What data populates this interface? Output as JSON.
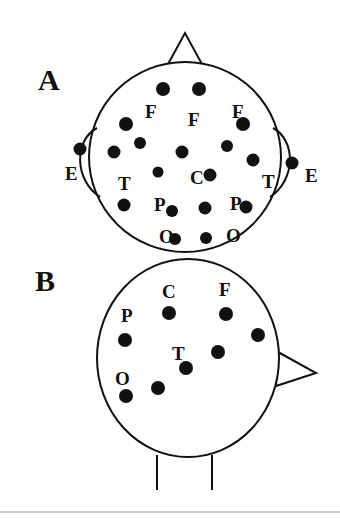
{
  "figure": {
    "width": 340,
    "height": 518,
    "background_color": "#ffffff",
    "ink_color": "#111111",
    "rule_color": "#b9b9b9"
  },
  "panels": [
    {
      "id": "A",
      "letter": "A",
      "letter_pos": {
        "x": 38,
        "y": 90
      },
      "view": "top-down head, nose up, both ears shown",
      "head": {
        "cx": 185,
        "cy": 157,
        "rx": 96,
        "ry": 95
      },
      "nose": {
        "apex": {
          "x": 185,
          "y": 33
        },
        "left": {
          "x": 167,
          "y": 66
        },
        "right": {
          "x": 203,
          "y": 66
        }
      },
      "ears": [
        {
          "side": "left",
          "path": "M 97 128 C 75 140, 75 178, 100 196"
        },
        {
          "side": "right",
          "path": "M 273 128 C 295 140, 295 178, 270 196"
        }
      ],
      "labels": [
        {
          "text": "F",
          "x": 145,
          "y": 118
        },
        {
          "text": "F",
          "x": 188,
          "y": 126
        },
        {
          "text": "F",
          "x": 232,
          "y": 118
        },
        {
          "text": "E",
          "x": 65,
          "y": 180
        },
        {
          "text": "T",
          "x": 118,
          "y": 190
        },
        {
          "text": "C",
          "x": 190,
          "y": 184
        },
        {
          "text": "T",
          "x": 262,
          "y": 188
        },
        {
          "text": "E",
          "x": 305,
          "y": 182
        },
        {
          "text": "P",
          "x": 154,
          "y": 211
        },
        {
          "text": "P",
          "x": 230,
          "y": 210
        },
        {
          "text": "O",
          "x": 159,
          "y": 243
        },
        {
          "text": "O",
          "x": 226,
          "y": 242
        }
      ],
      "electrodes": [
        {
          "x": 163,
          "y": 89,
          "r": 7
        },
        {
          "x": 199,
          "y": 89,
          "r": 7
        },
        {
          "x": 126,
          "y": 124,
          "r": 7
        },
        {
          "x": 243,
          "y": 124,
          "r": 7
        },
        {
          "x": 140,
          "y": 143,
          "r": 6
        },
        {
          "x": 227,
          "y": 146,
          "r": 6
        },
        {
          "x": 114,
          "y": 152,
          "r": 6.5
        },
        {
          "x": 253,
          "y": 160,
          "r": 6.5
        },
        {
          "x": 182,
          "y": 152,
          "r": 6.5
        },
        {
          "x": 158,
          "y": 172,
          "r": 5.5
        },
        {
          "x": 210,
          "y": 175,
          "r": 6.5
        },
        {
          "x": 80,
          "y": 149,
          "r": 6.5
        },
        {
          "x": 292,
          "y": 163,
          "r": 6.5
        },
        {
          "x": 124,
          "y": 205,
          "r": 6.5
        },
        {
          "x": 172,
          "y": 211,
          "r": 6
        },
        {
          "x": 205,
          "y": 208,
          "r": 6.5
        },
        {
          "x": 246,
          "y": 207,
          "r": 6.5
        },
        {
          "x": 175,
          "y": 239,
          "r": 6
        },
        {
          "x": 206,
          "y": 238,
          "r": 6
        }
      ]
    },
    {
      "id": "B",
      "letter": "B",
      "letter_pos": {
        "x": 35,
        "y": 291
      },
      "view": "side/oblique head, nose pointing right, neck shown",
      "head": {
        "cx": 188,
        "cy": 358,
        "rx": 91,
        "ry": 99
      },
      "nose": {
        "apex": {
          "x": 316,
          "y": 373
        },
        "top": {
          "x": 278,
          "y": 352
        },
        "bottom": {
          "x": 276,
          "y": 386
        }
      },
      "neck": [
        {
          "x": 157,
          "y1": 455,
          "y2": 490
        },
        {
          "x": 212,
          "y1": 455,
          "y2": 490
        }
      ],
      "labels": [
        {
          "text": "C",
          "x": 162,
          "y": 298
        },
        {
          "text": "F",
          "x": 219,
          "y": 296
        },
        {
          "text": "P",
          "x": 121,
          "y": 322
        },
        {
          "text": "T",
          "x": 172,
          "y": 360
        },
        {
          "text": "O",
          "x": 115,
          "y": 385
        }
      ],
      "electrodes": [
        {
          "x": 169,
          "y": 313,
          "r": 7
        },
        {
          "x": 226,
          "y": 314,
          "r": 7
        },
        {
          "x": 258,
          "y": 335,
          "r": 7
        },
        {
          "x": 125,
          "y": 340,
          "r": 7
        },
        {
          "x": 218,
          "y": 352,
          "r": 7
        },
        {
          "x": 186,
          "y": 368,
          "r": 7
        },
        {
          "x": 158,
          "y": 388,
          "r": 7
        },
        {
          "x": 126,
          "y": 396,
          "r": 7
        }
      ]
    }
  ],
  "footer_rule": {
    "x1": 0,
    "x2": 340,
    "y": 512
  }
}
